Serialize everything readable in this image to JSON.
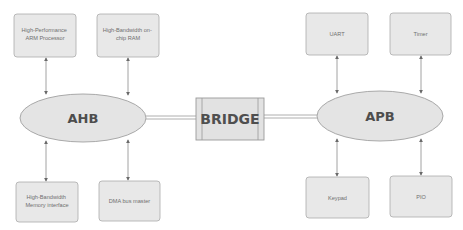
{
  "diagram": {
    "buses": {
      "ahb": {
        "label": "AHB"
      },
      "apb": {
        "label": "APB"
      }
    },
    "bridge": {
      "label": "BRIDGE"
    },
    "ahb_components": [
      {
        "id": "arm-processor",
        "lines": [
          "High-Performance",
          "ARM Processor"
        ],
        "position": "top"
      },
      {
        "id": "onchip-ram",
        "lines": [
          "High-Bandwidth on-",
          "chip RAM"
        ],
        "position": "top"
      },
      {
        "id": "memory-interface",
        "lines": [
          "High-Bandwidth",
          "Memory interface"
        ],
        "position": "bottom"
      },
      {
        "id": "dma-bus-master",
        "lines": [
          "DMA bus master"
        ],
        "position": "bottom"
      }
    ],
    "apb_components": [
      {
        "id": "uart",
        "lines": [
          "UART"
        ],
        "position": "top"
      },
      {
        "id": "timer",
        "lines": [
          "Timer"
        ],
        "position": "top"
      },
      {
        "id": "keypad",
        "lines": [
          "Keypad"
        ],
        "position": "bottom"
      },
      {
        "id": "pio",
        "lines": [
          "PIO"
        ],
        "position": "bottom"
      }
    ],
    "colors": {
      "fill": "#e6e6e6",
      "stroke": "#a9a9a9",
      "line": "#8a8a8a"
    }
  }
}
